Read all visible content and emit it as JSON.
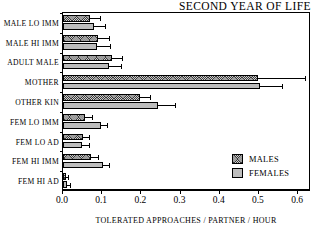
{
  "chart_data": {
    "type": "bar",
    "orientation": "horizontal",
    "title": "SECOND YEAR OF LIFE",
    "xlabel": "TOLERATED APPROACHES / PARTNER / HOUR",
    "ylabel": "",
    "xlim": [
      0.0,
      0.633
    ],
    "xticks": [
      0.0,
      0.1,
      0.2,
      0.3,
      0.4,
      0.5,
      0.6
    ],
    "xtick_labels": [
      "0.0",
      "0.1",
      "0.2",
      "0.3",
      "0.4",
      "0.5",
      "0.6"
    ],
    "grid": false,
    "legend_position": "lower-right",
    "categories": [
      "MALE LO IMM",
      "MALE HI IMM",
      "ADULT MALE",
      "MOTHER",
      "OTHER KIN",
      "FEM LO IMM",
      "FEM LO AD",
      "FEM HI IMM",
      "FEM HI AD"
    ],
    "series": [
      {
        "name": "MALES",
        "color": "#3a3a3a",
        "pattern": "crosshatch",
        "values": [
          0.07,
          0.089,
          0.126,
          0.497,
          0.196,
          0.055,
          0.051,
          0.072,
          0.007
        ],
        "errors_upper": [
          0.096,
          0.119,
          0.153,
          0.619,
          0.224,
          0.077,
          0.07,
          0.092,
          0.016
        ]
      },
      {
        "name": "FEMALES",
        "color": "#bdbdbd",
        "pattern": "solid",
        "values": [
          0.079,
          0.087,
          0.117,
          0.503,
          0.242,
          0.096,
          0.049,
          0.102,
          0.01
        ],
        "errors_upper": [
          0.109,
          0.122,
          0.151,
          0.561,
          0.289,
          0.115,
          0.068,
          0.119,
          0.02
        ]
      }
    ],
    "legend": [
      "MALES",
      "FEMALES"
    ]
  }
}
